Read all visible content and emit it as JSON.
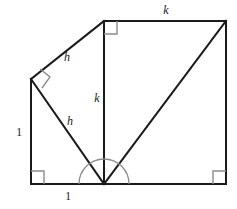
{
  "figure": {
    "stroke_color": "#1a1a1a",
    "marker_color": "#8c8c8c",
    "background": "#ffffff"
  },
  "labels": {
    "top_k": "k",
    "vertical_k": "k",
    "upper_h": "h",
    "lower_h": "h",
    "left_one": "1",
    "bottom_one": "1"
  },
  "points": {
    "bottom_left": {
      "x": 31,
      "y": 184
    },
    "left_vertex": {
      "x": 31,
      "y": 79
    },
    "apex": {
      "x": 104,
      "y": 184
    },
    "top_left": {
      "x": 104,
      "y": 21
    },
    "top_right": {
      "x": 226,
      "y": 21
    },
    "bottom_right": {
      "x": 226,
      "y": 184
    }
  },
  "label_positions": {
    "top_k": {
      "x": 166,
      "y": 11
    },
    "vertical_k": {
      "x": 97,
      "y": 99
    },
    "upper_h": {
      "x": 67,
      "y": 58
    },
    "lower_h": {
      "x": 70,
      "y": 122
    },
    "left_one": {
      "x": 19,
      "y": 133
    },
    "bottom_one": {
      "x": 68,
      "y": 197
    }
  },
  "markers": {
    "right_angles": [
      {
        "name": "bottom-left-right-angle",
        "x": 31,
        "y": 184,
        "size": 13
      },
      {
        "name": "bottom-right-right-angle",
        "x": 226,
        "y": 184,
        "size": 13
      },
      {
        "name": "top-left-right-angle",
        "x": 104,
        "y": 21,
        "size": 13
      },
      {
        "name": "left-vertex-right-angle",
        "x": 31,
        "y": 79,
        "size": 13
      }
    ],
    "angle_arc": {
      "name": "apex-angle-arc",
      "cx": 104,
      "cy": 184,
      "radius": 25
    }
  }
}
